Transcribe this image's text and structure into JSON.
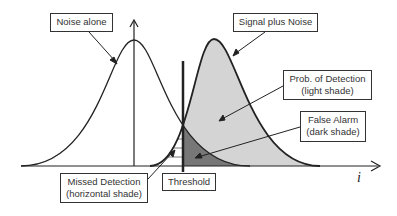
{
  "labels": {
    "noise_alone": "Noise alone",
    "signal_plus_noise": "Signal plus Noise",
    "prob_detection_line1": "Prob. of Detection",
    "prob_detection_line2": "(light shade)",
    "false_alarm_line1": "False Alarm",
    "false_alarm_line2": "(dark shade)",
    "missed_detection_line1": "Missed Detection",
    "missed_detection_line2": "(horizontal shade)",
    "threshold": "Threshold",
    "x_axis": "i"
  },
  "colors": {
    "light_shade": "#d4d4d4",
    "dark_shade": "#777777",
    "line": "#222222"
  }
}
